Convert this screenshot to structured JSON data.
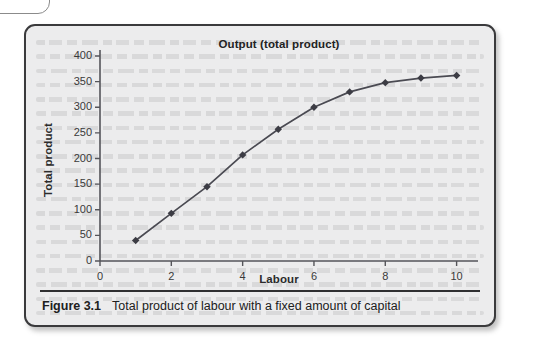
{
  "figure": {
    "caption_number": "Figure 3.1",
    "caption_text": "Total product of labour with a fixed amount of capital"
  },
  "colors": {
    "panel_background": "#ececed",
    "panel_border": "#3a3a3c",
    "line": "#4a4a52",
    "marker": "#3c3c44",
    "axis": "#55555a",
    "text": "#222222"
  },
  "chart_data": {
    "type": "line",
    "title": "Output (total product)",
    "xlabel": "Labour",
    "ylabel": "Total product",
    "x": [
      1,
      2,
      3,
      4,
      5,
      6,
      7,
      8,
      9,
      10
    ],
    "values": [
      40,
      93,
      145,
      207,
      257,
      300,
      330,
      348,
      357,
      362
    ],
    "series": [
      {
        "name": "Total product",
        "values": [
          40,
          93,
          145,
          207,
          257,
          300,
          330,
          348,
          357,
          362
        ]
      }
    ],
    "xlim": [
      0,
      10.6
    ],
    "ylim": [
      0,
      400
    ],
    "xticks": [
      0,
      2,
      4,
      6,
      8,
      10
    ],
    "xtick_labels": [
      "0",
      "2",
      "4",
      "6",
      "8",
      "10"
    ],
    "yticks": [
      0,
      50,
      100,
      150,
      200,
      250,
      300,
      350,
      400
    ],
    "ytick_labels": [
      "0",
      "50",
      "100",
      "150",
      "200",
      "250",
      "300",
      "350",
      "400"
    ],
    "grid": false,
    "legend": "none",
    "marker": "diamond"
  }
}
